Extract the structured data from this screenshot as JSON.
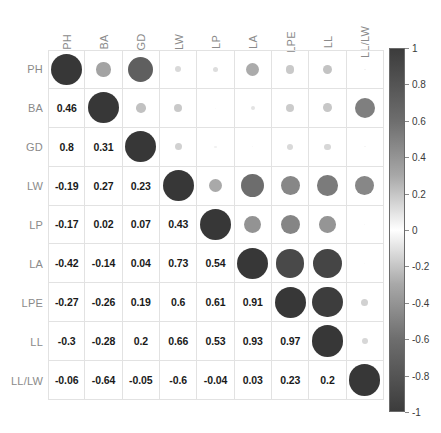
{
  "chart_data": {
    "type": "heatmap",
    "title": "",
    "xlabel": "",
    "ylabel": "",
    "grid": true,
    "legend_position": "right",
    "variables": [
      "PH",
      "BA",
      "GD",
      "LW",
      "LP",
      "LA",
      "LPE",
      "LL",
      "LL/LW"
    ],
    "categories": [
      "PH",
      "BA",
      "GD",
      "LW",
      "LP",
      "LA",
      "LPE",
      "LL",
      "LL/LW"
    ],
    "colorbar": {
      "min": -1,
      "max": 1,
      "ticks": [
        1,
        0.8,
        0.6,
        0.4,
        0.2,
        0,
        -0.2,
        -0.4,
        -0.6,
        -0.8,
        -1
      ],
      "tick_labels": [
        "1",
        "0.8",
        "0.6",
        "0.4",
        "0.2",
        "0",
        "-0.2",
        "-0.4",
        "-0.6",
        "-0.8",
        "-1"
      ],
      "colormap": "gray-diverging"
    },
    "matrix": [
      [
        1,
        0.46,
        0.8,
        -0.19,
        -0.17,
        -0.42,
        -0.27,
        -0.3,
        -0.06
      ],
      [
        0.46,
        1,
        0.31,
        0.27,
        0.02,
        -0.14,
        -0.26,
        -0.28,
        -0.64
      ],
      [
        0.8,
        0.31,
        1,
        0.23,
        0.07,
        0.04,
        0.19,
        0.2,
        -0.05
      ],
      [
        -0.19,
        0.27,
        0.23,
        1,
        0.43,
        0.73,
        0.6,
        0.66,
        -0.6
      ],
      [
        -0.17,
        0.02,
        0.07,
        0.43,
        1,
        0.54,
        0.61,
        0.53,
        -0.04
      ],
      [
        -0.42,
        -0.14,
        0.04,
        0.73,
        0.54,
        1,
        0.91,
        0.93,
        0.03
      ],
      [
        -0.27,
        -0.26,
        0.19,
        0.6,
        0.61,
        0.91,
        1,
        0.97,
        0.23
      ],
      [
        -0.3,
        -0.28,
        0.2,
        0.66,
        0.53,
        0.93,
        0.97,
        1,
        0.2
      ],
      [
        -0.06,
        -0.64,
        -0.05,
        -0.6,
        -0.04,
        0.03,
        0.23,
        0.2,
        1
      ]
    ],
    "lower_triangle_labels": [
      [
        "0.46"
      ],
      [
        "0.8",
        "0.31"
      ],
      [
        "-0.19",
        "0.27",
        "0.23"
      ],
      [
        "-0.17",
        "0.02",
        "0.07",
        "0.43"
      ],
      [
        "-0.42",
        "-0.14",
        "0.04",
        "0.73",
        "0.54"
      ],
      [
        "-0.27",
        "-0.26",
        "0.19",
        "0.6",
        "0.61",
        "0.91"
      ],
      [
        "-0.3",
        "-0.28",
        "0.2",
        "0.66",
        "0.53",
        "0.93",
        "0.97"
      ],
      [
        "-0.06",
        "-0.64",
        "-0.05",
        "-0.6",
        "-0.04",
        "0.03",
        "0.23",
        "0.2"
      ]
    ],
    "display": {
      "upper_triangle": "circles",
      "lower_triangle": "numbers",
      "diagonal": "circles"
    }
  }
}
